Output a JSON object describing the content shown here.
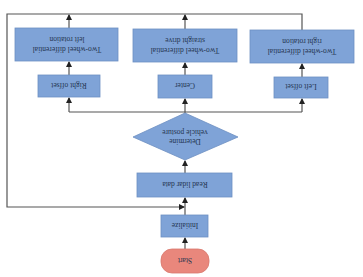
{
  "diagram": {
    "orientation": "rotated-180",
    "colors": {
      "process_fill": "#7fa3d7",
      "process_stroke": "#6d8fc2",
      "decision_fill": "#7fa3d7",
      "start_fill": "#e9877c",
      "start_stroke": "#d8776c",
      "line": "#555555",
      "text": "#24344f"
    },
    "nodes": {
      "start": {
        "label": "Start"
      },
      "initialize": {
        "label": "Initialize"
      },
      "read_lidar": {
        "label": "Read lidar data"
      },
      "decision": {
        "line1": "Determine",
        "line2": "vehicle posture"
      },
      "left_offset": {
        "label": "Left offset"
      },
      "center": {
        "label": "Center"
      },
      "right_offset": {
        "label": "Right offset"
      },
      "right_rotation": {
        "line1": "Two-wheel differential",
        "line2": "right rotation"
      },
      "straight_drive": {
        "line1": "Two-wheel differential",
        "line2": "straight drive"
      },
      "left_rotation": {
        "line1": "Two-wheel differential",
        "line2": "left rotation"
      }
    },
    "edges": [
      {
        "from": "Start",
        "to": "Initialize"
      },
      {
        "from": "Initialize",
        "to": "Read lidar data"
      },
      {
        "from": "Read lidar data",
        "to": "Determine vehicle posture"
      },
      {
        "from": "Determine vehicle posture",
        "to": "Left offset"
      },
      {
        "from": "Determine vehicle posture",
        "to": "Center"
      },
      {
        "from": "Determine vehicle posture",
        "to": "Right offset"
      },
      {
        "from": "Left offset",
        "to": "Two-wheel differential right rotation"
      },
      {
        "from": "Center",
        "to": "Two-wheel differential straight drive"
      },
      {
        "from": "Right offset",
        "to": "Two-wheel differential left rotation"
      },
      {
        "from": "Two-wheel differential actions",
        "to": "Read lidar data",
        "type": "loop-back"
      }
    ]
  }
}
